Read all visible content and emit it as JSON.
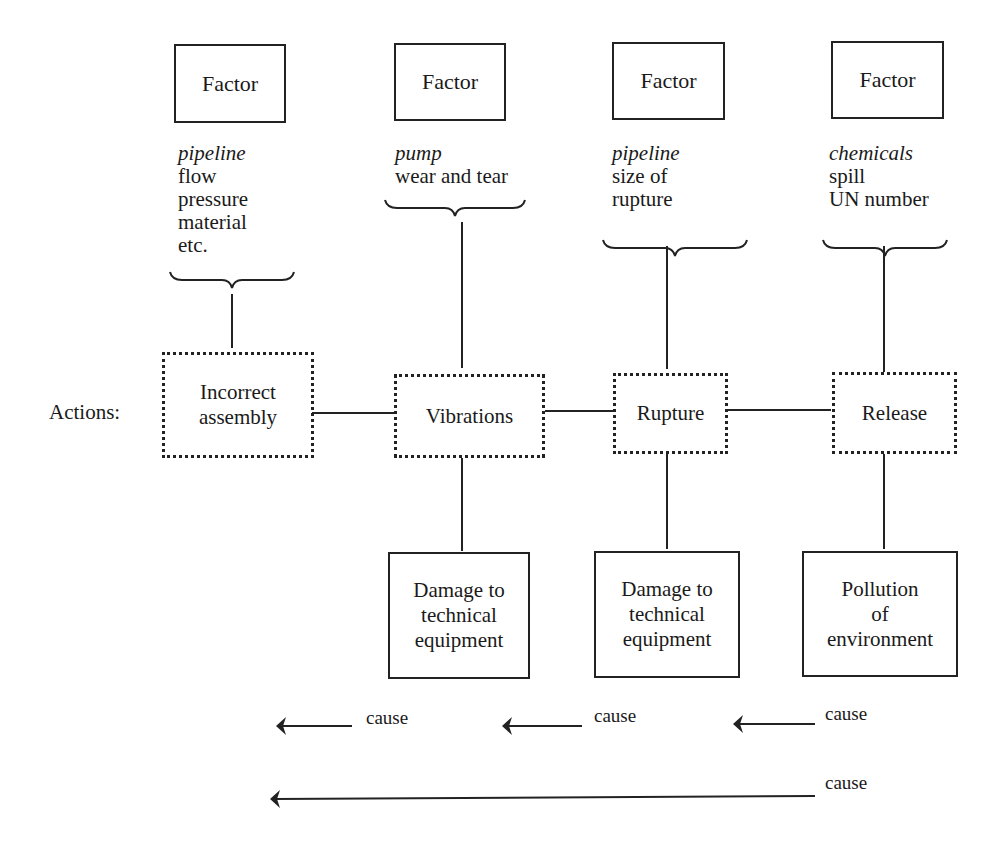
{
  "factors": [
    {
      "label": "Factor",
      "category": "pipeline",
      "details": [
        "flow",
        "pressure",
        "material",
        "etc."
      ]
    },
    {
      "label": "Factor",
      "category": "pump",
      "details": [
        "wear and tear"
      ]
    },
    {
      "label": "Factor",
      "category": "pipeline",
      "details": [
        "size of",
        "rupture"
      ]
    },
    {
      "label": "Factor",
      "category": "chemicals",
      "details": [
        "spill",
        "UN number"
      ]
    }
  ],
  "actions_label": "Actions:",
  "actions": [
    {
      "line1": "Incorrect",
      "line2": "assembly"
    },
    {
      "line1": "Vibrations",
      "line2": ""
    },
    {
      "line1": "Rupture",
      "line2": ""
    },
    {
      "line1": "Release",
      "line2": ""
    }
  ],
  "consequences": [
    {
      "line1": "Damage to",
      "line2": "technical",
      "line3": "equipment"
    },
    {
      "line1": "Damage to",
      "line2": "technical",
      "line3": "equipment"
    },
    {
      "line1": "Pollution",
      "line2": "of",
      "line3": "environment"
    }
  ],
  "cause_arrows": [
    {
      "label": "cause"
    },
    {
      "label": "cause"
    },
    {
      "label": "cause"
    },
    {
      "label": "cause"
    }
  ]
}
